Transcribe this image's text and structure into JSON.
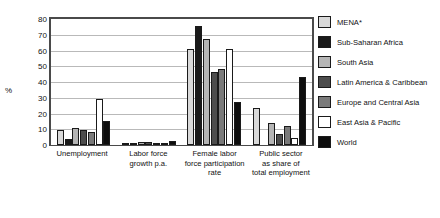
{
  "chart_data": {
    "type": "bar",
    "title": "",
    "xlabel": "",
    "ylabel": "%",
    "ylim": [
      0,
      80
    ],
    "ytick_step": 10,
    "yticks": [
      "0",
      "10",
      "20",
      "30",
      "40",
      "50",
      "60",
      "70",
      "80"
    ],
    "grid": true,
    "legend_position": "right",
    "categories": [
      "Unemployment",
      "Labor force growth p.a.",
      "Female labor force participation rate",
      "Public sector as share of total employment"
    ],
    "category_lines": [
      [
        "Unemployment"
      ],
      [
        "Labor force",
        "growth p.a."
      ],
      [
        "Female labor",
        "force participation",
        "rate"
      ],
      [
        "Public sector",
        "as share of",
        "total employment"
      ]
    ],
    "series": [
      {
        "name": "MENA*",
        "color": "#d9d9d9",
        "values": [
          9.5,
          1.3,
          61.0,
          23.5
        ]
      },
      {
        "name": "Sub-Saharan Africa",
        "color": "#1a1a1a",
        "values": [
          4.0,
          0.4,
          75.5,
          0.0
        ]
      },
      {
        "name": "South Asia",
        "color": "#b5b5b5",
        "values": [
          11.0,
          1.8,
          67.0,
          14.0
        ]
      },
      {
        "name": "Latin America & Caribbean",
        "color": "#4d4d4d",
        "values": [
          9.5,
          1.8,
          46.5,
          7.0
        ]
      },
      {
        "name": "Europe and Central Asia",
        "color": "#7a7a7a",
        "values": [
          8.0,
          1.5,
          48.0,
          12.0
        ]
      },
      {
        "name": "East Asia & Pacific",
        "color": "#ffffff",
        "values": [
          29.0,
          1.0,
          61.0,
          4.5
        ]
      },
      {
        "name": "World",
        "color": "#0d0d0d",
        "values": [
          15.0,
          2.5,
          27.0,
          43.0
        ]
      }
    ]
  },
  "legend": {
    "items": [
      {
        "label": "MENA*",
        "color": "#d9d9d9"
      },
      {
        "label": "Sub-Saharan Africa",
        "color": "#1a1a1a"
      },
      {
        "label": "South Asia",
        "color": "#b5b5b5"
      },
      {
        "label": "Latin America & Caribbean",
        "color": "#4d4d4d"
      },
      {
        "label": "Europe and Central Asia",
        "color": "#7a7a7a"
      },
      {
        "label": "East Asia & Pacific",
        "color": "#ffffff"
      },
      {
        "label": "World",
        "color": "#0d0d0d"
      }
    ]
  }
}
